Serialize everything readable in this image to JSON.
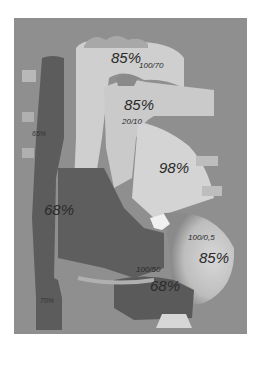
{
  "diagram": {
    "type": "anatomical-heart-oxygen-saturation",
    "colors": {
      "background": "#8f8f8f",
      "oxygenated": "#cfcfcf",
      "deoxygenated": "#5e5e5e",
      "mixed": "#7a7a7a",
      "valve": "#f0f0f0"
    },
    "labels": {
      "aorta_sat": "85%",
      "aorta_pressure": "100/70",
      "pulmonary_artery_sat": "85%",
      "pulmonary_artery_pressure": "20/10",
      "superior_vena_cava_sat": "65%",
      "left_atrium_sat": "98%",
      "right_atrium_sat": "68%",
      "left_ventricle_pressure": "100/0,5",
      "left_ventricle_sat": "85%",
      "right_ventricle_pressure": "100/50",
      "right_ventricle_sat": "68%",
      "inferior_vena_cava_sat": "70%"
    }
  }
}
